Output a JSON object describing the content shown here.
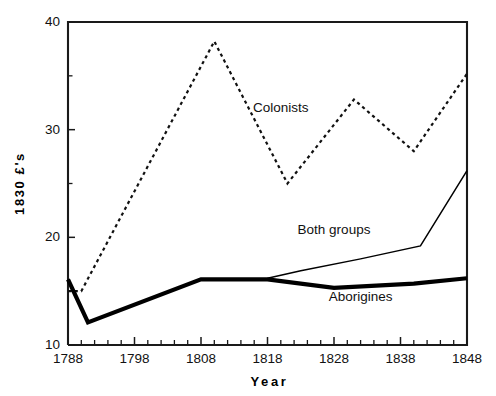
{
  "chart_data": {
    "type": "line",
    "title": "",
    "xlabel": "Year",
    "ylabel": "1830 £'s",
    "xlim": [
      1788,
      1848
    ],
    "ylim": [
      10,
      40
    ],
    "grid": false,
    "legend_position": "inline-annotations",
    "x_major_ticks": [
      1788,
      1798,
      1808,
      1818,
      1828,
      1838,
      1848
    ],
    "x_major_tick_labels": [
      "1788",
      "1798",
      "1808",
      "1818",
      "1828",
      "1838",
      "1848"
    ],
    "x_minor_tick_interval": 2,
    "y_major_ticks": [
      10,
      20,
      30,
      40
    ],
    "y_major_tick_labels": [
      "10",
      "20",
      "30",
      "40"
    ],
    "y_minor_ticks": [
      15,
      25,
      35
    ],
    "series": [
      {
        "name": "Colonists",
        "style": "dotted",
        "label_x": 1820,
        "label_y": 31.6,
        "x": [
          1788,
          1790,
          1810,
          1821,
          1831,
          1840,
          1848
        ],
        "values": [
          15.0,
          15.0,
          38.2,
          25.0,
          32.8,
          28.0,
          35.2
        ]
      },
      {
        "name": "Both groups",
        "style": "thin-solid",
        "label_x": 1828,
        "label_y": 20.3,
        "x": [
          1818,
          1823,
          1832,
          1841,
          1848
        ],
        "values": [
          16.2,
          16.9,
          18.0,
          19.2,
          26.2
        ]
      },
      {
        "name": "Aborigines",
        "style": "thick-solid",
        "label_x": 1832,
        "label_y": 14.1,
        "x": [
          1788,
          1791,
          1808,
          1818,
          1828,
          1840,
          1848
        ],
        "values": [
          16.1,
          12.1,
          16.1,
          16.1,
          15.3,
          15.7,
          16.2
        ]
      }
    ],
    "colors": {
      "axis": "#1a1a1a",
      "series_colonists": "#111111",
      "series_both_groups": "#000000",
      "series_aborigines": "#000000",
      "background": "#ffffff"
    }
  }
}
